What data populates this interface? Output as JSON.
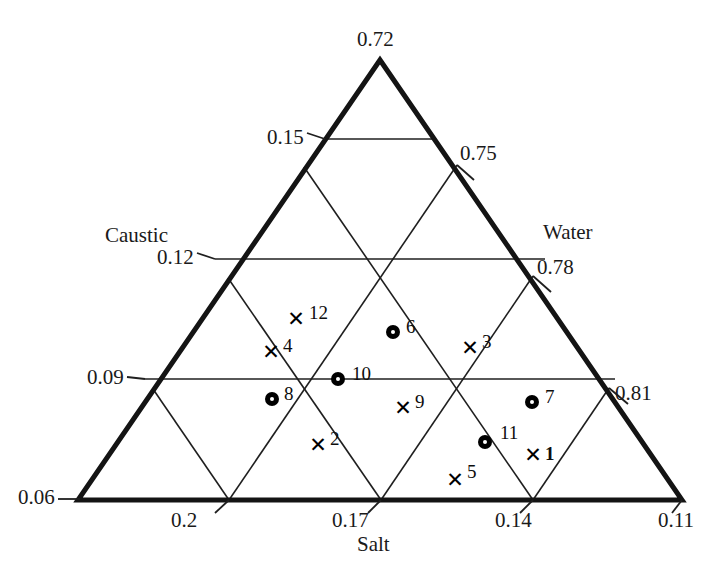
{
  "chart_data": {
    "type": "scatter",
    "title": "",
    "diagram_kind": "ternary-phase-diagram",
    "axes": {
      "bottom": {
        "name": "Salt",
        "label_position": "bottom-center",
        "ticks": [
          "0.2",
          "0.17",
          "0.14",
          "0.11"
        ],
        "corner_value": "0.11",
        "direction": "right-to-left decreasing"
      },
      "right": {
        "name": "Water",
        "label_position": "right",
        "ticks": [
          "0.72",
          "0.75",
          "0.78",
          "0.81"
        ],
        "corner_value": "0.72",
        "direction": "apex-to-bottom-right increasing"
      },
      "left": {
        "name": "Caustic",
        "label_position": "left",
        "ticks": [
          "0.06",
          "0.09",
          "0.12",
          "0.15"
        ],
        "corner_value": "0.06",
        "direction": "bottom-to-apex increasing"
      }
    },
    "grid": true,
    "legend": null,
    "marker_kinds": {
      "cross": "x-marker",
      "circle": "o-marker"
    },
    "points": [
      {
        "label": "1",
        "marker": "cross",
        "salt": 0.139,
        "water": 0.789,
        "caustic": 0.072,
        "px": 533,
        "py": 454,
        "lx": 545,
        "ly": 444,
        "bold": true
      },
      {
        "label": "2",
        "marker": "cross",
        "salt": 0.175,
        "water": 0.748,
        "caustic": 0.077,
        "px": 318,
        "py": 444,
        "lx": 330,
        "ly": 429,
        "bold": false
      },
      {
        "label": "3",
        "marker": "cross",
        "salt": 0.15,
        "water": 0.751,
        "caustic": 0.099,
        "px": 470,
        "py": 347,
        "lx": 482,
        "ly": 332,
        "bold": false
      },
      {
        "label": "4",
        "marker": "cross",
        "salt": 0.191,
        "water": 0.712,
        "caustic": 0.097,
        "px": 271,
        "py": 351,
        "lx": 283,
        "ly": 336,
        "bold": false
      },
      {
        "label": "5",
        "marker": "cross",
        "salt": 0.15,
        "water": 0.783,
        "caustic": 0.067,
        "px": 455,
        "py": 479,
        "lx": 467,
        "ly": 462,
        "bold": false
      },
      {
        "label": "6",
        "marker": "circle",
        "salt": 0.166,
        "water": 0.73,
        "caustic": 0.104,
        "px": 393,
        "py": 332,
        "lx": 406,
        "ly": 317,
        "bold": false
      },
      {
        "label": "7",
        "marker": "circle",
        "salt": 0.137,
        "water": 0.773,
        "caustic": 0.09,
        "px": 532,
        "py": 402,
        "lx": 545,
        "ly": 387,
        "bold": false
      },
      {
        "label": "8",
        "marker": "circle",
        "salt": 0.189,
        "water": 0.723,
        "caustic": 0.088,
        "px": 272,
        "py": 399,
        "lx": 284,
        "ly": 384,
        "bold": false
      },
      {
        "label": "9",
        "marker": "cross",
        "salt": 0.16,
        "water": 0.752,
        "caustic": 0.088,
        "px": 403,
        "py": 407,
        "lx": 415,
        "ly": 392,
        "bold": false
      },
      {
        "label": "10",
        "marker": "circle",
        "salt": 0.175,
        "water": 0.735,
        "caustic": 0.09,
        "px": 338,
        "py": 379,
        "lx": 352,
        "ly": 364,
        "bold": false
      },
      {
        "label": "11",
        "marker": "circle",
        "salt": 0.146,
        "water": 0.779,
        "caustic": 0.075,
        "px": 485,
        "py": 442,
        "lx": 500,
        "ly": 423,
        "bold": false
      },
      {
        "label": "12",
        "marker": "cross",
        "salt": 0.186,
        "water": 0.709,
        "caustic": 0.105,
        "px": 296,
        "py": 318,
        "lx": 309,
        "ly": 303,
        "bold": false
      }
    ]
  },
  "axis_titles": {
    "left": "Caustic",
    "right": "Water",
    "bottom": "Salt"
  },
  "tick_labels": {
    "apex": "0.72",
    "left_side": [
      "0.15",
      "0.12",
      "0.09",
      "0.06"
    ],
    "right_side": [
      "0.75",
      "0.78",
      "0.81"
    ],
    "bottom": [
      "0.2",
      "0.17",
      "0.14",
      "0.11"
    ]
  },
  "colors": {
    "line": "#141414",
    "grid": "#1f1f1f",
    "marker": "#000000",
    "background": "#ffffff"
  }
}
